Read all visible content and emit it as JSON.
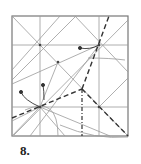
{
  "step": {
    "number_label": "8."
  },
  "colors": {
    "crease": "#9a9a9a",
    "border": "#777777",
    "fold": "#333333",
    "text": "#222222"
  },
  "diagram": {
    "square": {
      "x": 12,
      "y": 16,
      "w": 116,
      "h": 120
    },
    "creases": [
      [
        12,
        45,
        128,
        45
      ],
      [
        12,
        107,
        128,
        107
      ],
      [
        40,
        16,
        40,
        136
      ],
      [
        99,
        16,
        99,
        136
      ],
      [
        12,
        16,
        128,
        136
      ],
      [
        12,
        80,
        76,
        16
      ],
      [
        14,
        135,
        128,
        20
      ],
      [
        12,
        84,
        99,
        45
      ],
      [
        30,
        136,
        99,
        45
      ],
      [
        60,
        16,
        12,
        70
      ],
      [
        40,
        107,
        110,
        136
      ],
      [
        12,
        121,
        40,
        107
      ],
      [
        40,
        107,
        65,
        136
      ],
      [
        75,
        16,
        128,
        72
      ],
      [
        40,
        107,
        12,
        136
      ],
      [
        99,
        107,
        128,
        78
      ],
      [
        40,
        107,
        58,
        62
      ]
    ],
    "arcs": [
      "M 25 110 Q 58 95 58 136",
      "M 60 125 Q 95 140 128 137",
      "M 88 58 Q 110 58 125 60"
    ],
    "valley_folds": [
      [
        12,
        118,
        82,
        89
      ],
      [
        82,
        89,
        109,
        16
      ],
      [
        82,
        89,
        128,
        136
      ]
    ],
    "dash_dot": [
      [
        82,
        89,
        82,
        136
      ]
    ],
    "arrows": [
      {
        "path": "M 40 107 Q 24 100 21 92",
        "tip": [
          21,
          92
        ]
      },
      {
        "path": "M 44 100 Q 44 90 43 85",
        "tip": [
          43,
          85
        ]
      },
      {
        "path": "M 99 45 Q 90 50 80 48",
        "tip": [
          80,
          48
        ]
      }
    ],
    "points": [
      [
        40,
        107
      ],
      [
        99,
        45
      ],
      [
        99,
        107
      ],
      [
        58,
        62
      ],
      [
        40,
        45
      ]
    ]
  }
}
